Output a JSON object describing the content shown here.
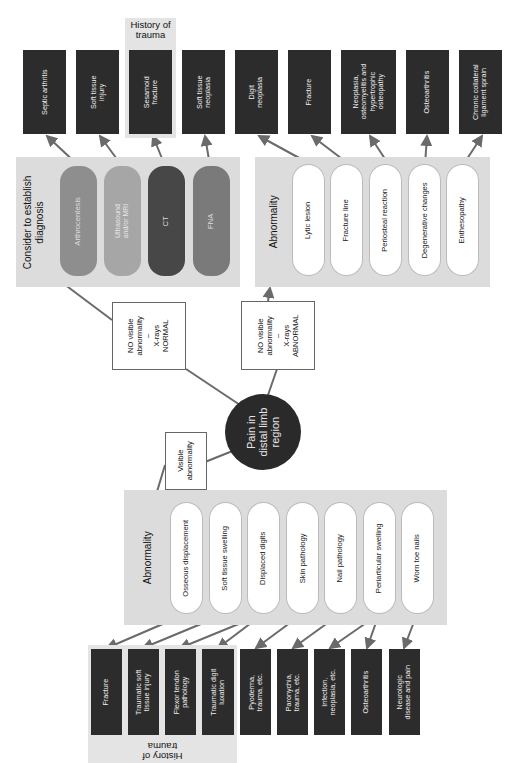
{
  "center": {
    "label": "Pain in distal limb region",
    "lines": [
      "Pain in",
      "distal limb",
      "region"
    ]
  },
  "branches": {
    "normal": {
      "lines": [
        "NO visible",
        "abnormality",
        "–",
        "X-rays",
        "NORMAL"
      ]
    },
    "abnormal_xray": {
      "lines": [
        "NO visible",
        "abnormality",
        "–",
        "X-rays",
        "ABNORMAL"
      ]
    },
    "visible": {
      "lines": [
        "Visible",
        "abnormality"
      ]
    }
  },
  "diagnosis_panel": {
    "title_lines": [
      "Consider to establish",
      "diagnosis"
    ],
    "tests": [
      {
        "label": "Arthrocentesis",
        "color": "#8e8e8e"
      },
      {
        "label": "Ultrasound and/or MRI",
        "color": "#a6a6a6"
      },
      {
        "label": "CT",
        "color": "#474747"
      },
      {
        "label": "FNA",
        "color": "#7a7a7a"
      }
    ],
    "outcomes": [
      {
        "lines": [
          "Septic arthritis"
        ]
      },
      {
        "lines": [
          "Soft tissue",
          "injury"
        ]
      },
      {
        "lines": [
          "Sesamoid",
          "fracture"
        ]
      },
      {
        "lines": [
          "Soft tissue",
          "neoplasia"
        ]
      }
    ],
    "history_label": [
      "History of",
      "trauma"
    ]
  },
  "xray_panel": {
    "title": "Abnormality",
    "findings": [
      "Lytic lesion",
      "Fracture line",
      "Periosteal reaction",
      "Degenerative changes",
      "Enthesopathy"
    ],
    "outcomes": [
      {
        "lines": [
          "Digit",
          "neoplasia"
        ]
      },
      {
        "lines": [
          "Fracture"
        ]
      },
      {
        "lines": [
          "Neoplasia,",
          "osteomyelitis and",
          "hypertrophic",
          "osteopathy"
        ]
      },
      {
        "lines": [
          "Osteoarthritis"
        ]
      },
      {
        "lines": [
          "Chronic collateral",
          "ligament sprain"
        ]
      }
    ]
  },
  "visible_panel": {
    "title": "Abnormality",
    "findings": [
      "Osseous displacement",
      "Soft tissue swelling",
      "Displaced digits",
      "Skin pathology",
      "Nail pathology",
      "Periarticular swelling",
      "Worn toe nails"
    ],
    "outcomes": [
      {
        "lines": [
          "Fracture"
        ]
      },
      {
        "lines": [
          "Traumatic soft",
          "tissue injury"
        ]
      },
      {
        "lines": [
          "Flexor tendon",
          "pathology"
        ]
      },
      {
        "lines": [
          "Traumatic digit",
          "luxation"
        ]
      },
      {
        "lines": [
          "Pyoderma,",
          "trauma, etc."
        ]
      },
      {
        "lines": [
          "Paronychia,",
          "trauma, etc."
        ]
      },
      {
        "lines": [
          "Infection,",
          "neoplasia, etc."
        ]
      },
      {
        "lines": [
          "Osteoarthritis"
        ]
      },
      {
        "lines": [
          "Neurologic",
          "disease and pain"
        ]
      }
    ],
    "history_label": [
      "History of",
      "trauma"
    ]
  },
  "colors": {
    "panel": "#dcdcdc",
    "dark_box": "#2c2c2c",
    "arrow": "#6a6a6a",
    "circle": "#2a2a2a"
  }
}
